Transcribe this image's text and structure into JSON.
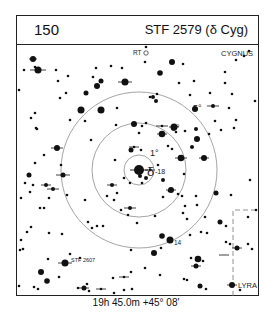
{
  "header": {
    "chart_number": "150",
    "title": "STF 2579 (δ Cyg)"
  },
  "caption": "19h 45.0m  +45° 08'",
  "center": {
    "x": 139,
    "y": 170
  },
  "circles": [
    {
      "label": "1°",
      "r": 15,
      "label_x": 150,
      "label_y": 156
    },
    {
      "label": "3°",
      "r": 47,
      "label_x": 171,
      "label_y": 131
    },
    {
      "label": "5°",
      "r": 78,
      "label_x": 193,
      "label_y": 111
    }
  ],
  "labels": {
    "center_star": "δ",
    "center_mag": "-18",
    "variable": "RT",
    "constellation_main": "CYGNUS",
    "constellation_other": "LYRA",
    "double_star": "STF 2607",
    "comparison": "14"
  },
  "colors": {
    "ink": "#111111",
    "circle": "#9a9a9a",
    "border": "#222222"
  },
  "stars": [
    [
      33,
      59,
      3
    ],
    [
      35,
      67,
      1.3
    ],
    [
      24,
      70,
      1.3
    ],
    [
      38,
      70,
      3.5
    ],
    [
      56,
      70,
      1.3
    ],
    [
      68,
      76,
      1.3
    ],
    [
      58,
      81,
      1.3
    ],
    [
      96,
      68,
      1.3
    ],
    [
      111,
      66,
      1.3
    ],
    [
      122,
      68,
      1.3
    ],
    [
      93,
      77,
      1.3
    ],
    [
      101,
      81,
      2.5
    ],
    [
      97,
      86,
      3
    ],
    [
      125,
      82,
      3.5
    ],
    [
      66,
      93,
      1.3
    ],
    [
      86,
      93,
      2.5
    ],
    [
      81,
      110,
      3.5
    ],
    [
      101,
      110,
      3.5
    ],
    [
      60,
      98,
      1.3
    ],
    [
      35,
      113,
      1.3
    ],
    [
      31,
      118,
      1.3
    ],
    [
      36,
      128,
      1.3
    ],
    [
      37,
      129,
      1.3
    ],
    [
      19,
      90,
      1.3
    ],
    [
      70,
      120,
      1.3
    ],
    [
      85,
      121,
      1.3
    ],
    [
      172,
      62,
      3
    ],
    [
      145,
      62,
      1.3
    ],
    [
      160,
      73,
      2.8
    ],
    [
      146,
      47,
      1.3
    ],
    [
      183,
      64,
      1.3
    ],
    [
      179,
      83,
      1.3
    ],
    [
      194,
      81,
      1.3
    ],
    [
      236,
      60,
      1.3
    ],
    [
      249,
      51,
      1.3
    ],
    [
      244,
      56,
      1.3
    ],
    [
      225,
      72,
      1.3
    ],
    [
      225,
      83,
      1.3
    ],
    [
      190,
      95,
      1.3
    ],
    [
      210,
      93,
      1.3
    ],
    [
      232,
      94,
      1.3
    ],
    [
      157,
      94,
      1.3
    ],
    [
      150,
      97,
      1.3
    ],
    [
      156,
      101,
      2
    ],
    [
      153,
      97,
      2
    ],
    [
      117,
      108,
      1.3
    ],
    [
      213,
      106,
      2
    ],
    [
      195,
      109,
      3
    ],
    [
      236,
      120,
      1.3
    ],
    [
      229,
      108,
      1.3
    ],
    [
      255,
      101,
      1.3
    ],
    [
      234,
      128,
      1.3
    ],
    [
      162,
      126,
      1.3
    ],
    [
      174,
      127,
      3.5
    ],
    [
      176,
      132,
      1.3
    ],
    [
      196,
      129,
      2
    ],
    [
      185,
      131,
      1.3
    ],
    [
      197,
      139,
      3
    ],
    [
      221,
      130,
      1.3
    ],
    [
      215,
      121,
      1.3
    ],
    [
      209,
      134,
      1.3
    ],
    [
      116,
      125,
      1.3
    ],
    [
      134,
      124,
      3
    ],
    [
      146,
      123,
      1.3
    ],
    [
      142,
      126,
      1.3
    ],
    [
      139,
      133,
      1.3
    ],
    [
      134,
      147,
      1.3
    ],
    [
      141,
      150,
      1.3
    ],
    [
      131,
      150,
      2.5
    ],
    [
      162,
      134,
      3.3
    ],
    [
      168,
      146,
      1.3
    ],
    [
      172,
      149,
      1.3
    ],
    [
      181,
      158,
      3.3
    ],
    [
      115,
      160,
      1.3
    ],
    [
      158,
      165,
      1.3
    ],
    [
      150,
      170,
      1.3
    ],
    [
      124,
      178,
      1.3
    ],
    [
      130,
      183,
      1.3
    ],
    [
      140,
      176,
      2
    ],
    [
      142,
      183,
      1.3
    ],
    [
      163,
      180,
      2
    ],
    [
      169,
      191,
      1.3
    ],
    [
      171,
      190,
      3
    ],
    [
      163,
      197,
      1.3
    ],
    [
      178,
      194,
      1.3
    ],
    [
      182,
      196,
      1.3
    ],
    [
      185,
      206,
      1.3
    ],
    [
      112,
      185,
      2
    ],
    [
      117,
      193,
      1.3
    ],
    [
      107,
      196,
      1.3
    ],
    [
      85,
      200,
      1.3
    ],
    [
      114,
      200,
      1.3
    ],
    [
      121,
      210,
      1.3
    ],
    [
      130,
      208,
      2
    ],
    [
      128,
      215,
      1.3
    ],
    [
      137,
      223,
      1.3
    ],
    [
      155,
      216,
      1.3
    ],
    [
      183,
      213,
      1.3
    ],
    [
      187,
      219,
      1.3
    ],
    [
      97,
      226,
      1.3
    ],
    [
      103,
      226,
      1.3
    ],
    [
      92,
      228,
      1.3
    ],
    [
      88,
      222,
      1.3
    ],
    [
      33,
      185,
      1.3
    ],
    [
      25,
      183,
      1.3
    ],
    [
      46,
      185,
      2
    ],
    [
      49,
      198,
      1.3
    ],
    [
      53,
      189,
      2
    ],
    [
      63,
      175,
      2.5
    ],
    [
      61,
      165,
      1.3
    ],
    [
      67,
      195,
      1.3
    ],
    [
      91,
      140,
      1.3
    ],
    [
      57,
      148,
      3
    ],
    [
      29,
      175,
      2.5
    ],
    [
      30,
      192,
      1.3
    ],
    [
      44,
      155,
      1.3
    ],
    [
      35,
      163,
      1.3
    ],
    [
      21,
      198,
      1.3
    ],
    [
      40,
      208,
      1.3
    ],
    [
      44,
      208,
      1.3
    ],
    [
      27,
      232,
      1.3
    ],
    [
      21,
      240,
      1.3
    ],
    [
      23,
      249,
      1.3
    ],
    [
      31,
      227,
      1.3
    ],
    [
      184,
      174,
      1.3
    ],
    [
      204,
      158,
      3
    ],
    [
      192,
      147,
      2
    ],
    [
      196,
      196,
      1.3
    ],
    [
      197,
      205,
      1.3
    ],
    [
      220,
      222,
      2.5
    ],
    [
      231,
      195,
      1.3
    ],
    [
      216,
      193,
      2.5
    ],
    [
      205,
      217,
      1.3
    ],
    [
      226,
      226,
      1.3
    ],
    [
      226,
      242,
      1.3
    ],
    [
      250,
      180,
      1.3
    ],
    [
      256,
      210,
      1.3
    ],
    [
      248,
      217,
      1.3
    ],
    [
      162,
      236,
      2.8
    ],
    [
      170,
      240,
      3.5
    ],
    [
      190,
      235,
      1.3
    ],
    [
      207,
      233,
      1.3
    ],
    [
      201,
      232,
      1.3
    ],
    [
      161,
      248,
      1.3
    ],
    [
      198,
      259,
      3.3
    ],
    [
      203,
      261,
      1.3
    ],
    [
      191,
      258,
      1.3
    ],
    [
      196,
      266,
      2.5
    ],
    [
      230,
      244,
      1.3
    ],
    [
      187,
      280,
      1.3
    ],
    [
      200,
      286,
      2.5
    ],
    [
      206,
      289,
      1.3
    ],
    [
      232,
      285,
      3
    ],
    [
      240,
      290,
      1.3
    ],
    [
      237,
      248,
      2.5
    ],
    [
      248,
      244,
      1.3
    ],
    [
      252,
      249,
      1.3
    ],
    [
      49,
      233,
      1.3
    ],
    [
      62,
      234,
      1.3
    ],
    [
      70,
      254,
      1.3
    ],
    [
      65,
      263,
      3.5
    ],
    [
      80,
      258,
      1.3
    ],
    [
      48,
      259,
      1.3
    ],
    [
      20,
      250,
      1.3
    ],
    [
      41,
      272,
      3
    ],
    [
      47,
      281,
      2.8
    ],
    [
      59,
      277,
      1.3
    ],
    [
      78,
      288,
      1.3
    ],
    [
      87,
      284,
      1.3
    ],
    [
      89,
      291,
      1.3
    ],
    [
      84,
      288,
      2.5
    ],
    [
      101,
      289,
      1.3
    ],
    [
      34,
      287,
      1.3
    ],
    [
      38,
      289,
      1.3
    ],
    [
      19,
      286,
      1.3
    ],
    [
      131,
      250,
      1.3
    ],
    [
      131,
      272,
      1.3
    ],
    [
      113,
      278,
      1.3
    ],
    [
      114,
      293,
      1.3
    ],
    [
      124,
      290,
      1.3
    ],
    [
      124,
      277,
      1.3
    ],
    [
      154,
      253,
      3
    ],
    [
      160,
      275,
      1.3
    ],
    [
      184,
      279,
      1.3
    ],
    [
      145,
      268,
      1.3
    ],
    [
      132,
      289,
      1.3
    ]
  ],
  "crossed_stars": [
    [
      38,
      70,
      8
    ],
    [
      125,
      82,
      7
    ],
    [
      63,
      175,
      7
    ],
    [
      57,
      148,
      6
    ],
    [
      162,
      126,
      6
    ],
    [
      174,
      127,
      5
    ],
    [
      181,
      158,
      6
    ],
    [
      162,
      134,
      5
    ],
    [
      134,
      147,
      5
    ],
    [
      171,
      190,
      5
    ],
    [
      130,
      208,
      6
    ],
    [
      112,
      185,
      5
    ],
    [
      150,
      170,
      5
    ],
    [
      46,
      185,
      5
    ],
    [
      53,
      189,
      6
    ],
    [
      65,
      263,
      7
    ],
    [
      84,
      288,
      5
    ],
    [
      124,
      277,
      5
    ],
    [
      101,
      289,
      5
    ],
    [
      196,
      266,
      5
    ],
    [
      232,
      285,
      5
    ],
    [
      204,
      158,
      5
    ],
    [
      213,
      106,
      6
    ],
    [
      237,
      248,
      5
    ],
    [
      224,
      255,
      5
    ],
    [
      33,
      59,
      4
    ]
  ],
  "center_star": {
    "x": 139,
    "y": 170,
    "r": 5
  }
}
